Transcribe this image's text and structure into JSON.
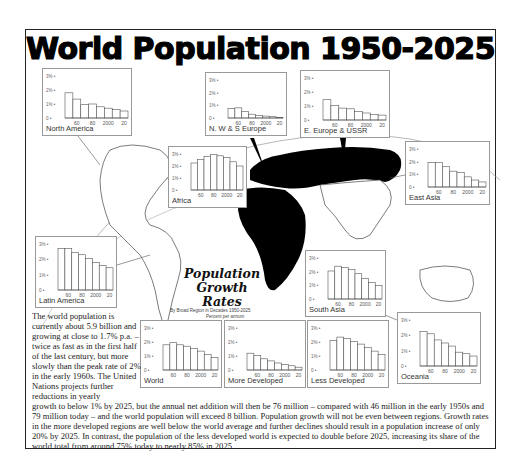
{
  "title": "World Population 1950-2025",
  "caption": {
    "line1": "Population",
    "line2": "Growth",
    "line3": "Rates",
    "sub1": "By Broad Region in Decades 1950-2025",
    "sub2": "Percent per annum"
  },
  "body_text": {
    "left": "The world population is currently about 5.9 billion and growing at close to 1.7% p.a. – twice as fast as in the first half of the last century, but more slowly than the peak rate of 2% in the early 1960s. The United Nations projects further reductions in yearly",
    "bottom": "growth to below 1% by 2025, but the annual net addition will then be 76 million – compared with 46 million in the early 1950s and 79 million today – and the world population will exceed 8 billion. Population growth will not be even between regions. Growth rates in the more developed regions are well below the world average and further declines should result in a population increase of only 20% by 2025. In contrast, the population of the less developed world is expected to double before 2025, increasing its share of the world total from around 75% today to nearly 85% in 2025."
  },
  "axis": {
    "y_ticks": [
      "0",
      "1%",
      "2%",
      "3%"
    ],
    "x_ticks": [
      "60",
      "80",
      "2000",
      "20"
    ]
  },
  "chart_data": {
    "type": "bar",
    "ylabel": "Percent per annum",
    "xlabel": "Decade",
    "ylim": [
      0,
      3
    ],
    "categories": [
      "1950s",
      "1960s",
      "1970s",
      "1980s",
      "1990s",
      "2000s",
      "2010s",
      "2020-25"
    ],
    "x_tick_labels": [
      "60",
      "80",
      "2000",
      "20"
    ],
    "grid": false,
    "series": [
      {
        "name": "North America",
        "values": [
          1.8,
          1.35,
          0.95,
          1.0,
          0.8,
          0.7,
          0.6,
          0.5
        ]
      },
      {
        "name": "N. W & S Europe",
        "values": [
          0.75,
          0.8,
          0.5,
          0.3,
          0.2,
          0.15,
          0.1,
          0.05
        ]
      },
      {
        "name": "E. Europe & USSR",
        "values": [
          1.45,
          1.05,
          0.85,
          0.8,
          0.6,
          0.5,
          0.4,
          0.35
        ]
      },
      {
        "name": "Africa",
        "values": [
          2.25,
          2.55,
          2.8,
          2.95,
          2.85,
          2.7,
          2.35,
          2.0
        ]
      },
      {
        "name": "East Asia",
        "values": [
          1.95,
          1.95,
          1.6,
          1.25,
          1.15,
          0.8,
          0.55,
          0.4
        ]
      },
      {
        "name": "Latin America",
        "values": [
          2.7,
          2.7,
          2.45,
          2.3,
          2.05,
          1.8,
          1.6,
          1.45
        ]
      },
      {
        "name": "South Asia",
        "values": [
          2.05,
          2.4,
          2.3,
          2.15,
          1.85,
          1.5,
          1.2,
          1.0
        ]
      },
      {
        "name": "Oceania",
        "values": [
          2.25,
          2.1,
          1.7,
          1.5,
          1.3,
          0.9,
          0.8,
          0.65
        ]
      },
      {
        "name": "World",
        "values": [
          1.8,
          1.95,
          1.8,
          1.7,
          1.55,
          1.35,
          1.1,
          0.9
        ]
      },
      {
        "name": "More Developed",
        "values": [
          1.2,
          1.05,
          0.8,
          0.65,
          0.5,
          0.4,
          0.3,
          0.2
        ]
      },
      {
        "name": "Less Developed",
        "values": [
          2.1,
          2.35,
          2.25,
          2.05,
          1.85,
          1.6,
          1.35,
          1.1
        ]
      }
    ]
  },
  "panels": [
    {
      "id": "north-america",
      "label": "North America",
      "x": 42,
      "y": 68,
      "w": 90,
      "h": 68
    },
    {
      "id": "nws-europe",
      "label": "N. W & S Europe",
      "x": 205,
      "y": 72,
      "w": 82,
      "h": 64
    },
    {
      "id": "e-europe-ussr",
      "label": "E. Europe & USSR",
      "x": 300,
      "y": 70,
      "w": 90,
      "h": 68
    },
    {
      "id": "africa",
      "label": "Africa",
      "x": 168,
      "y": 146,
      "w": 79,
      "h": 62
    },
    {
      "id": "east-asia",
      "label": "East Asia",
      "x": 405,
      "y": 141,
      "w": 85,
      "h": 64
    },
    {
      "id": "latin-america",
      "label": "Latin America",
      "x": 35,
      "y": 236,
      "w": 82,
      "h": 72
    },
    {
      "id": "south-asia",
      "label": "South Asia",
      "x": 305,
      "y": 250,
      "w": 81,
      "h": 67
    },
    {
      "id": "oceania",
      "label": "Oceania",
      "x": 397,
      "y": 312,
      "w": 84,
      "h": 72
    },
    {
      "id": "world",
      "label": "World",
      "x": 140,
      "y": 320,
      "w": 82,
      "h": 68
    },
    {
      "id": "more-developed",
      "label": "More Developed",
      "x": 224,
      "y": 320,
      "w": 82,
      "h": 68
    },
    {
      "id": "less-developed",
      "label": "Less Developed",
      "x": 307,
      "y": 320,
      "w": 82,
      "h": 68
    }
  ]
}
